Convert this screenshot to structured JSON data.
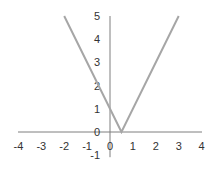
{
  "chart_data": {
    "type": "line",
    "title": "",
    "xlabel": "",
    "ylabel": "",
    "function": "y = |2x - 1|",
    "series": [
      {
        "name": "y = |2x - 1|",
        "x": [
          -2,
          0,
          0.5,
          3
        ],
        "y": [
          5,
          1,
          0,
          5
        ],
        "color": "#a6a6a6"
      }
    ],
    "xlim": [
      -4,
      4
    ],
    "ylim": [
      -1,
      5
    ],
    "x_ticks": [
      "-4",
      "-3",
      "-2",
      "-1",
      "0",
      "1",
      "2",
      "3",
      "4"
    ],
    "y_ticks": [
      "-1",
      "0",
      "1",
      "2",
      "3",
      "4",
      "5"
    ],
    "grid": false,
    "legend": "none"
  },
  "axis_color": "#7f7f7f",
  "line_color": "#a6a6a6"
}
